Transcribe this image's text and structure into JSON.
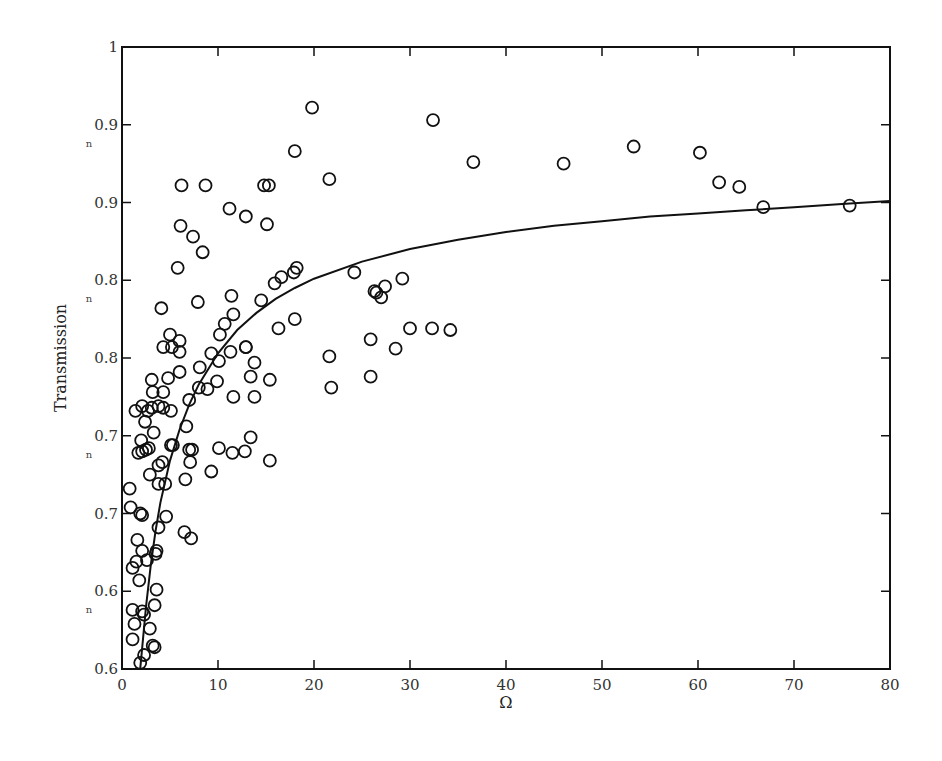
{
  "chart_data": {
    "type": "scatter",
    "title": "",
    "xlabel": "Ω",
    "ylabel": "Transmission",
    "xlim": [
      0,
      80
    ],
    "ylim": [
      0.6,
      1.0
    ],
    "grid": false,
    "legend": null,
    "x_ticks": [
      0,
      10,
      20,
      30,
      40,
      50,
      60,
      70,
      80
    ],
    "x_tick_labels": [
      "0",
      "10",
      "20",
      "30",
      "40",
      "50",
      "60",
      "70",
      "80"
    ],
    "y_ticks": [
      0.6,
      0.65,
      0.7,
      0.75,
      0.8,
      0.85,
      0.9,
      0.95,
      1.0
    ],
    "y_tick_labels": [
      "0.6",
      "0.6",
      "0.7",
      "0.7",
      "0.8",
      "0.8",
      "0.9",
      "0.9",
      "1"
    ],
    "y_tick_submarks": [
      false,
      true,
      false,
      true,
      false,
      true,
      false,
      true,
      false
    ],
    "series": [
      {
        "name": "measured",
        "style": "open-circle",
        "points": [
          [
            19.8,
            0.961
          ],
          [
            32.4,
            0.953
          ],
          [
            53.3,
            0.936
          ],
          [
            60.2,
            0.932
          ],
          [
            62.2,
            0.913
          ],
          [
            64.3,
            0.91
          ],
          [
            66.8,
            0.897
          ],
          [
            75.8,
            0.898
          ],
          [
            36.6,
            0.926
          ],
          [
            46.0,
            0.925
          ],
          [
            21.6,
            0.915
          ],
          [
            18.0,
            0.933
          ],
          [
            14.8,
            0.911
          ],
          [
            15.3,
            0.911
          ],
          [
            8.7,
            0.911
          ],
          [
            6.2,
            0.911
          ],
          [
            11.2,
            0.896
          ],
          [
            12.9,
            0.891
          ],
          [
            15.1,
            0.886
          ],
          [
            6.1,
            0.885
          ],
          [
            7.4,
            0.878
          ],
          [
            8.4,
            0.868
          ],
          [
            5.8,
            0.858
          ],
          [
            18.2,
            0.858
          ],
          [
            17.9,
            0.855
          ],
          [
            16.6,
            0.852
          ],
          [
            15.9,
            0.848
          ],
          [
            11.4,
            0.84
          ],
          [
            14.5,
            0.837
          ],
          [
            7.9,
            0.836
          ],
          [
            24.2,
            0.855
          ],
          [
            27.4,
            0.846
          ],
          [
            26.5,
            0.842
          ],
          [
            27.0,
            0.839
          ],
          [
            26.3,
            0.843
          ],
          [
            29.2,
            0.851
          ],
          [
            4.1,
            0.832
          ],
          [
            11.6,
            0.828
          ],
          [
            10.7,
            0.822
          ],
          [
            10.2,
            0.815
          ],
          [
            16.3,
            0.819
          ],
          [
            18.0,
            0.825
          ],
          [
            5.0,
            0.815
          ],
          [
            25.9,
            0.812
          ],
          [
            30.0,
            0.819
          ],
          [
            32.3,
            0.819
          ],
          [
            34.2,
            0.818
          ],
          [
            28.5,
            0.806
          ],
          [
            21.6,
            0.801
          ],
          [
            6.0,
            0.811
          ],
          [
            12.9,
            0.807
          ],
          [
            4.3,
            0.807
          ],
          [
            5.2,
            0.807
          ],
          [
            6.0,
            0.804
          ],
          [
            9.3,
            0.803
          ],
          [
            11.3,
            0.804
          ],
          [
            12.9,
            0.807
          ],
          [
            13.8,
            0.797
          ],
          [
            8.1,
            0.794
          ],
          [
            10.1,
            0.798
          ],
          [
            6.0,
            0.791
          ],
          [
            13.4,
            0.788
          ],
          [
            15.4,
            0.786
          ],
          [
            25.9,
            0.788
          ],
          [
            21.8,
            0.781
          ],
          [
            3.1,
            0.786
          ],
          [
            4.8,
            0.787
          ],
          [
            9.9,
            0.785
          ],
          [
            8.0,
            0.781
          ],
          [
            8.9,
            0.78
          ],
          [
            11.6,
            0.775
          ],
          [
            13.8,
            0.775
          ],
          [
            3.2,
            0.778
          ],
          [
            4.3,
            0.778
          ],
          [
            7.0,
            0.773
          ],
          [
            3.8,
            0.769
          ],
          [
            3.1,
            0.768
          ],
          [
            4.3,
            0.768
          ],
          [
            5.1,
            0.766
          ],
          [
            2.1,
            0.769
          ],
          [
            2.7,
            0.766
          ],
          [
            1.4,
            0.766
          ],
          [
            2.4,
            0.759
          ],
          [
            6.7,
            0.756
          ],
          [
            3.3,
            0.752
          ],
          [
            13.4,
            0.749
          ],
          [
            5.3,
            0.744
          ],
          [
            2.0,
            0.747
          ],
          [
            2.5,
            0.741
          ],
          [
            2.1,
            0.74
          ],
          [
            2.8,
            0.742
          ],
          [
            1.7,
            0.739
          ],
          [
            5.1,
            0.744
          ],
          [
            7.0,
            0.741
          ],
          [
            7.3,
            0.741
          ],
          [
            10.1,
            0.742
          ],
          [
            11.5,
            0.739
          ],
          [
            12.8,
            0.74
          ],
          [
            15.4,
            0.734
          ],
          [
            3.8,
            0.731
          ],
          [
            4.2,
            0.733
          ],
          [
            7.1,
            0.733
          ],
          [
            2.9,
            0.725
          ],
          [
            9.3,
            0.727
          ],
          [
            3.8,
            0.719
          ],
          [
            4.5,
            0.719
          ],
          [
            6.6,
            0.722
          ],
          [
            0.8,
            0.716
          ],
          [
            0.9,
            0.704
          ],
          [
            1.9,
            0.7
          ],
          [
            2.1,
            0.699
          ],
          [
            4.6,
            0.698
          ],
          [
            3.8,
            0.691
          ],
          [
            6.5,
            0.688
          ],
          [
            1.6,
            0.683
          ],
          [
            7.2,
            0.684
          ],
          [
            2.1,
            0.676
          ],
          [
            3.6,
            0.676
          ],
          [
            3.5,
            0.674
          ],
          [
            2.6,
            0.67
          ],
          [
            1.5,
            0.669
          ],
          [
            1.1,
            0.665
          ],
          [
            1.8,
            0.657
          ],
          [
            3.6,
            0.651
          ],
          [
            3.4,
            0.641
          ],
          [
            1.1,
            0.638
          ],
          [
            2.1,
            0.637
          ],
          [
            2.3,
            0.635
          ],
          [
            1.3,
            0.629
          ],
          [
            2.9,
            0.626
          ],
          [
            1.1,
            0.619
          ],
          [
            3.2,
            0.615
          ],
          [
            3.4,
            0.614
          ],
          [
            2.3,
            0.609
          ],
          [
            1.9,
            0.604
          ]
        ]
      },
      {
        "name": "fit",
        "style": "line",
        "points": [
          [
            1.9,
            0.6
          ],
          [
            2.5,
            0.64
          ],
          [
            3.0,
            0.667
          ],
          [
            3.5,
            0.689
          ],
          [
            4.0,
            0.707
          ],
          [
            5.0,
            0.734
          ],
          [
            6.0,
            0.754
          ],
          [
            7.0,
            0.77
          ],
          [
            8.0,
            0.783
          ],
          [
            10.0,
            0.803
          ],
          [
            12.0,
            0.818
          ],
          [
            14.0,
            0.829
          ],
          [
            16.0,
            0.838
          ],
          [
            18.0,
            0.845
          ],
          [
            20.0,
            0.851
          ],
          [
            25.0,
            0.862
          ],
          [
            30.0,
            0.87
          ],
          [
            35.0,
            0.876
          ],
          [
            40.0,
            0.881
          ],
          [
            45.0,
            0.885
          ],
          [
            50.0,
            0.888
          ],
          [
            55.0,
            0.891
          ],
          [
            60.0,
            0.893
          ],
          [
            65.0,
            0.895
          ],
          [
            70.0,
            0.897
          ],
          [
            75.0,
            0.899
          ],
          [
            80.0,
            0.901
          ]
        ]
      }
    ]
  },
  "axes": {
    "x_title": "Ω",
    "y_title": "Transmission",
    "sub_mark_glyph": "n"
  }
}
